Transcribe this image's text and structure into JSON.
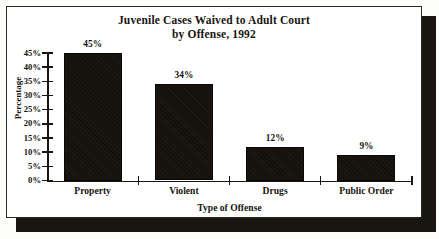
{
  "figure": {
    "title_line_1": "Juvenile Cases Waived to Adult Court",
    "title_line_2": "by Offense, 1992"
  },
  "chart_data": {
    "type": "bar",
    "title": "Juvenile Cases Waived to Adult Court by Offense, 1992",
    "xlabel": "Type of Offense",
    "ylabel": "Percentage",
    "categories": [
      "Property",
      "Violent",
      "Drugs",
      "Public Order"
    ],
    "values": [
      45,
      34,
      12,
      9
    ],
    "value_labels": [
      "45%",
      "34%",
      "12%",
      "9%"
    ],
    "ylim": [
      0,
      45
    ],
    "ytick_values": [
      0,
      5,
      10,
      15,
      20,
      25,
      30,
      35,
      40,
      45
    ],
    "ytick_labels": [
      "0%",
      "5%",
      "10%",
      "15%",
      "20%",
      "25%",
      "30%",
      "35%",
      "40%",
      "45%"
    ],
    "grid": false,
    "legend": false,
    "bar_color": "#14110c",
    "axis_color": "#19160f",
    "background": "#ffffff"
  },
  "colors": {
    "bar": "#14110c",
    "axis": "#19160f",
    "text": "#17140f",
    "frame_border": "#2a2622",
    "shadow": "#18160f",
    "page": "#fdfdfb"
  }
}
